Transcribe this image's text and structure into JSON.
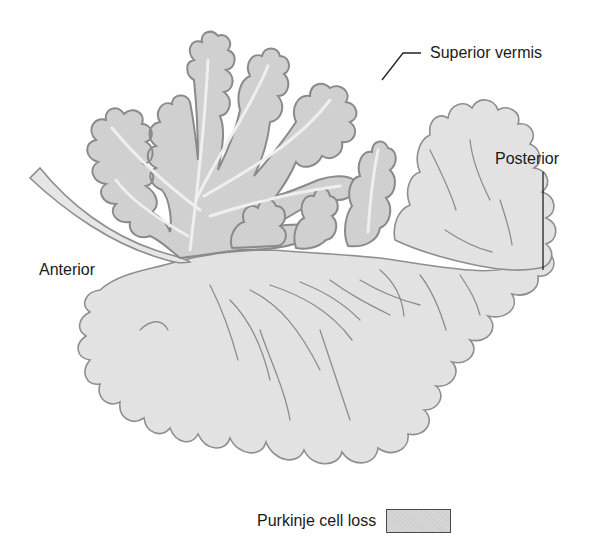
{
  "figure": {
    "labels": {
      "superior": "Superior vermis",
      "posterior": "Posterior",
      "anterior": "Anterior"
    },
    "legend": {
      "text": "Purkinje cell loss",
      "swatch_color": "#d6d6d6",
      "swatch_border": "#4a4a4a"
    },
    "colors": {
      "background": "#ffffff",
      "tissue_fill": "#e4e4e4",
      "affected_fill": "#cfcfcf",
      "outline": "#8a8a8a",
      "white_matter": "#eeeeee",
      "leader_line": "#222222"
    }
  }
}
